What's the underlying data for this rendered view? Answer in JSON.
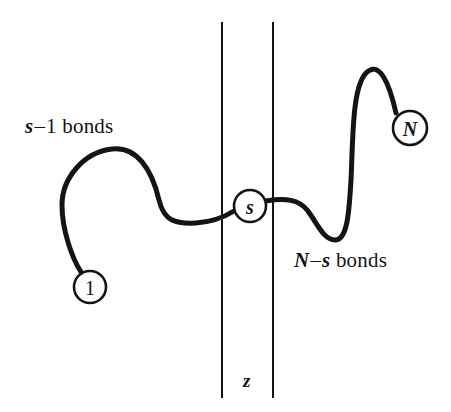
{
  "figure": {
    "background_color": "#ffffff",
    "stroke_color": "#141414",
    "chain_stroke_width": 5,
    "slab_stroke_width": 2,
    "width": 451,
    "height": 412
  },
  "nodes": [
    {
      "id": "start",
      "label": "1",
      "style": "plain",
      "cx": 90,
      "cy": 287,
      "r": 16
    },
    {
      "id": "contact",
      "label": "s",
      "style": "italic",
      "cx": 250,
      "cy": 206,
      "r": 16
    },
    {
      "id": "end",
      "label": "N",
      "style": "italic",
      "cx": 410,
      "cy": 128,
      "r": 17
    }
  ],
  "labels": {
    "left_segment": {
      "symbol": "s",
      "operator": "–",
      "count": "1",
      "word": "bonds",
      "full_text": "s – 1 bonds"
    },
    "right_segment": {
      "symbol_first": "N",
      "operator": "–",
      "symbol_second": "s",
      "word": "bonds",
      "full_text": "N – s bonds"
    },
    "slab_width": {
      "text": "z"
    }
  },
  "slab": {
    "left_line_x": 222,
    "right_line_x": 273,
    "top_y": 22,
    "bottom_y": 398
  },
  "chain_data": {
    "type": "freeform-curve",
    "left_segment_path": "M 81 272 C 72 258 62 230 62 205 C 62 178 84 152 112 149 C 137 146 152 170 159 200 C 164 221 175 224 196 223 C 213 222 226 216 234 211",
    "right_segment_path": "M 266 201 C 285 198 299 199 308 211 C 318 225 324 240 335 240 C 347 240 349 215 351 180 C 353 139 352 88 366 73 C 379 60 389 82 396 113"
  }
}
